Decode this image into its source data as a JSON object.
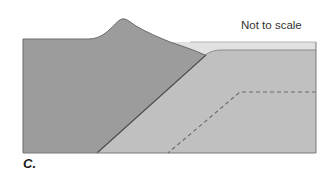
{
  "diagram": {
    "note": "Not to scale",
    "panel_label": "C.",
    "layers": [
      {
        "name": "continental-crust",
        "color": "#9c9c9c"
      },
      {
        "name": "ocean-water",
        "color": "#e2e2e2"
      },
      {
        "name": "oceanic-plate",
        "color": "#c0c0c0"
      }
    ],
    "colors": {
      "outline": "#5a5a5a",
      "dashed_line": "#6a6a6a",
      "text": "#333333"
    }
  }
}
